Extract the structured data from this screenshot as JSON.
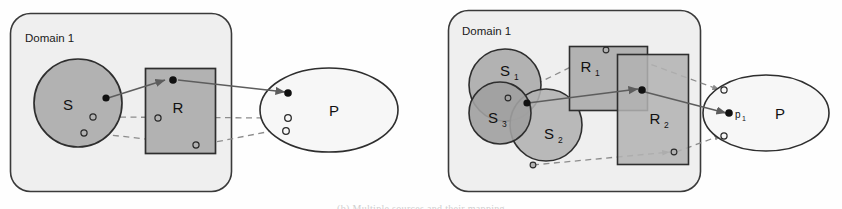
{
  "figure": {
    "background": "#fefefe",
    "palette": {
      "domain_fill": "#efefef",
      "domain_stroke": "#3a3a3a",
      "set_fill": "#b2b2b2",
      "set_stroke": "#2e2e2e",
      "overlap_fill": "#9a9a9a",
      "ellipse_fill": "#f7f7f7",
      "solid_link": "#5d5d5d",
      "dashed_link": "#8c8c8c",
      "dot_filled": "#111111",
      "dot_hollow_stroke": "#2a2a2a"
    },
    "caption_partial": "(b) Multiple sources and their mapping"
  },
  "panels": [
    {
      "id": "panel-a",
      "domain": {
        "label": "Domain 1"
      },
      "sources": [
        {
          "name": "S",
          "label": "S",
          "subscript": "",
          "shape": "circle"
        }
      ],
      "relations": [
        {
          "name": "R",
          "label": "R",
          "subscript": "",
          "shape": "rectangle"
        }
      ],
      "target": {
        "name": "P",
        "label": "P",
        "shape": "ellipse",
        "point_label": ""
      },
      "points": {
        "filled_count": 1,
        "hollow_count": 2
      },
      "links": {
        "solid_count": 2,
        "dashed_count": 4
      }
    },
    {
      "id": "panel-b",
      "domain": {
        "label": "Domain 1"
      },
      "sources": [
        {
          "name": "S1",
          "label": "S",
          "subscript": "1",
          "shape": "circle"
        },
        {
          "name": "S2",
          "label": "S",
          "subscript": "2",
          "shape": "circle"
        },
        {
          "name": "S3",
          "label": "S",
          "subscript": "3",
          "shape": "circle"
        }
      ],
      "relations": [
        {
          "name": "R1",
          "label": "R",
          "subscript": "1",
          "shape": "rectangle"
        },
        {
          "name": "R2",
          "label": "R",
          "subscript": "2",
          "shape": "rectangle"
        }
      ],
      "target": {
        "name": "P",
        "label": "P",
        "shape": "ellipse",
        "point_label": "p",
        "point_subscript": "1"
      },
      "points": {
        "filled_count": 1,
        "hollow_count": 2
      },
      "links": {
        "solid_count": 2,
        "dashed_count": 4
      }
    }
  ]
}
